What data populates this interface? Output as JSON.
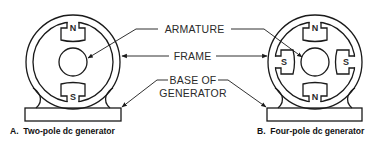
{
  "labels": {
    "armature": "ARMATURE",
    "frame": "FRAME",
    "base_line1": "BASE OF",
    "base_line2": "GENERATOR"
  },
  "generators": [
    {
      "id": "A",
      "caption": "A.  Two-pole dc generator",
      "poles": [
        {
          "label": "N",
          "position": "top"
        },
        {
          "label": "S",
          "position": "bottom"
        }
      ]
    },
    {
      "id": "B",
      "caption": "B.  Four-pole dc generator",
      "poles": [
        {
          "label": "N",
          "position": "top"
        },
        {
          "label": "S",
          "position": "right"
        },
        {
          "label": "N",
          "position": "bottom"
        },
        {
          "label": "S",
          "position": "left"
        }
      ]
    }
  ],
  "colors": {
    "line": "#1a1a1a",
    "background": "#ffffff"
  }
}
